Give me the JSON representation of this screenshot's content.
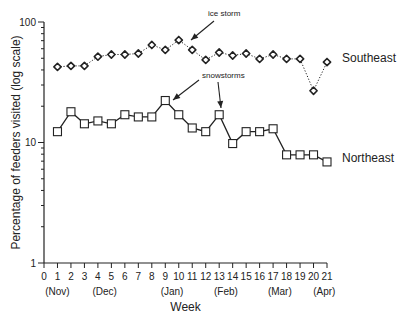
{
  "chart_data": {
    "type": "line",
    "title": "",
    "xlabel": "Week",
    "ylabel": "Percentage of feeders visited (log scale)",
    "yscale": "log",
    "ylim": [
      1,
      100
    ],
    "xlim": [
      0,
      21
    ],
    "y_ticks": [
      "1",
      "10",
      "100"
    ],
    "x": [
      1,
      2,
      3,
      4,
      5,
      6,
      7,
      8,
      9,
      10,
      11,
      12,
      13,
      14,
      15,
      16,
      17,
      18,
      19,
      20,
      21
    ],
    "x_tick_labels": [
      "0",
      "1",
      "2",
      "3",
      "4",
      "5",
      "6",
      "7",
      "8",
      "9",
      "10",
      "11",
      "12",
      "13",
      "14",
      "15",
      "16",
      "17",
      "18",
      "19",
      "20",
      "21"
    ],
    "month_labels": [
      {
        "week": 1,
        "label": "(Nov)"
      },
      {
        "week": 4.5,
        "label": "(Dec)"
      },
      {
        "week": 9.5,
        "label": "(Jan)"
      },
      {
        "week": 13.5,
        "label": "(Feb)"
      },
      {
        "week": 17.5,
        "label": "(Mar)"
      },
      {
        "week": 20.8,
        "label": "(Apr)"
      }
    ],
    "series": [
      {
        "name": "Southeast",
        "marker": "diamond",
        "line": "dotted",
        "values": [
          42.4,
          43.2,
          43.2,
          51.6,
          53.7,
          53.7,
          54.8,
          64.5,
          58.7,
          70.8,
          58.7,
          48.5,
          55.8,
          52.7,
          54.8,
          49.4,
          53.7,
          49.4,
          49.4,
          26.9,
          46.5
        ]
      },
      {
        "name": "Northeast",
        "marker": "square",
        "line": "solid",
        "values": [
          12.3,
          18.0,
          14.3,
          15.1,
          14.3,
          17.0,
          16.3,
          16.3,
          22.3,
          17.0,
          13.2,
          12.3,
          17.0,
          9.8,
          12.3,
          12.3,
          13.0,
          7.9,
          7.9,
          7.9,
          6.9
        ]
      }
    ],
    "annotations": [
      {
        "text": "ice storm",
        "points_to_week": 10,
        "series": "Southeast"
      },
      {
        "text": "snowstorms",
        "points_to_week": [
          9,
          13
        ],
        "series": "Northeast"
      }
    ],
    "grid": false,
    "legend": "inline labels at right"
  }
}
